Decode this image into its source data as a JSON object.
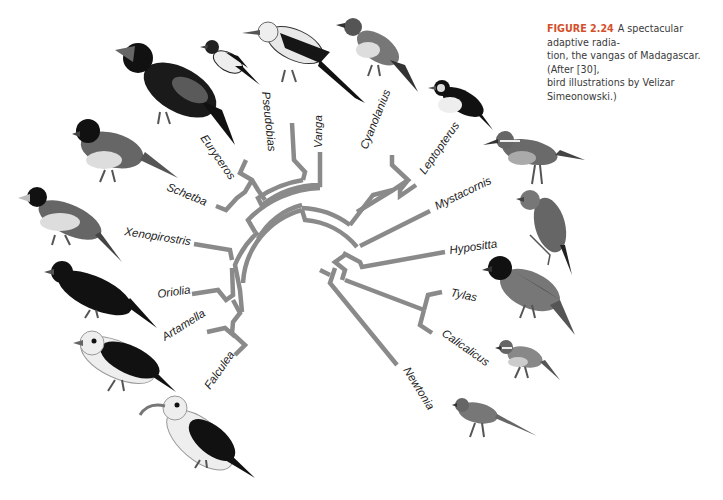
{
  "caption": {
    "figure_number": "FIGURE 2.24",
    "text": "A spectacular adaptive radiation, the vangas of Madagascar. (After [30], bird illustrations by Velizar Simeonowski.)",
    "lines": [
      "A spectacular adaptive radia-",
      "tion, the vangas of Madagascar. (After [30],",
      "bird illustrations by Velizar Simeonowski.)"
    ]
  },
  "colors": {
    "branch": "#8a8a8a",
    "label": "#222222",
    "figure_number": "#d4502a",
    "caption_text": "#3a3a3a"
  },
  "tree": {
    "type": "circular-phylogeny",
    "taxa": [
      {
        "id": "falculea",
        "label": "Falculea"
      },
      {
        "id": "artamella",
        "label": "Artamella"
      },
      {
        "id": "oriolia",
        "label": "Oriolia"
      },
      {
        "id": "xenopirostris",
        "label": "Xenopirostris"
      },
      {
        "id": "schetba",
        "label": "Schetba"
      },
      {
        "id": "euryceros",
        "label": "Euryceros"
      },
      {
        "id": "pseudobias",
        "label": "Pseudobias"
      },
      {
        "id": "vanga",
        "label": "Vanga"
      },
      {
        "id": "cyanolanius",
        "label": "Cyanolanius"
      },
      {
        "id": "leptopterus",
        "label": "Leptopterus"
      },
      {
        "id": "mystacornis",
        "label": "Mystacornis"
      },
      {
        "id": "hypositta",
        "label": "Hypositta"
      },
      {
        "id": "tylas",
        "label": "Tylas"
      },
      {
        "id": "calicalicus",
        "label": "Calicalicus"
      },
      {
        "id": "newtonia",
        "label": "Newtonia"
      }
    ]
  },
  "birds": [
    {
      "name": "euryceros-bird"
    },
    {
      "name": "pseudobias-bird"
    },
    {
      "name": "vanga-bird"
    },
    {
      "name": "cyanolanius-bird"
    },
    {
      "name": "leptopterus-bird"
    },
    {
      "name": "mystacornis-bird"
    },
    {
      "name": "hypositta-bird"
    },
    {
      "name": "tylas-bird"
    },
    {
      "name": "calicalicus-bird"
    },
    {
      "name": "newtonia-bird"
    },
    {
      "name": "schetba-bird"
    },
    {
      "name": "xenopirostris-bird"
    },
    {
      "name": "oriolia-bird"
    },
    {
      "name": "artamella-bird"
    },
    {
      "name": "falculea-bird"
    }
  ]
}
